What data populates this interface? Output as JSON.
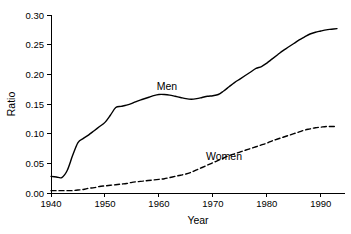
{
  "chart_data": {
    "type": "line",
    "title": "",
    "xlabel": "Year",
    "ylabel": "Ratio",
    "xlim": [
      1940,
      1993
    ],
    "ylim": [
      0.0,
      0.3
    ],
    "grid": false,
    "legend_position": "inline-annotation",
    "x_ticks": [
      1940,
      1950,
      1960,
      1970,
      1980,
      1990
    ],
    "x_tick_labels": [
      "1940",
      "1950",
      "1960",
      "1970",
      "1980",
      "1990"
    ],
    "y_ticks": [
      0.0,
      0.05,
      0.1,
      0.15,
      0.2,
      0.25,
      0.3
    ],
    "y_tick_labels": [
      "0.00",
      "0.05",
      "0.10",
      "0.15",
      "0.20",
      "0.25",
      "0.30"
    ],
    "series": [
      {
        "name": "Men",
        "style": "solid",
        "color": "#000000",
        "annotation": "Men",
        "x": [
          1940,
          1941,
          1942,
          1943,
          1944,
          1945,
          1946,
          1947,
          1948,
          1949,
          1950,
          1951,
          1952,
          1953,
          1954,
          1955,
          1956,
          1957,
          1958,
          1959,
          1960,
          1961,
          1962,
          1963,
          1964,
          1965,
          1966,
          1967,
          1968,
          1969,
          1970,
          1971,
          1972,
          1973,
          1974,
          1975,
          1976,
          1977,
          1978,
          1979,
          1980,
          1981,
          1982,
          1983,
          1984,
          1985,
          1986,
          1987,
          1988,
          1989,
          1990,
          1991,
          1992,
          1993
        ],
        "y": [
          0.028,
          0.027,
          0.026,
          0.038,
          0.063,
          0.085,
          0.092,
          0.098,
          0.105,
          0.112,
          0.119,
          0.131,
          0.144,
          0.146,
          0.148,
          0.151,
          0.155,
          0.158,
          0.161,
          0.164,
          0.166,
          0.166,
          0.165,
          0.163,
          0.161,
          0.159,
          0.158,
          0.159,
          0.161,
          0.163,
          0.164,
          0.166,
          0.172,
          0.179,
          0.186,
          0.192,
          0.198,
          0.204,
          0.21,
          0.213,
          0.219,
          0.226,
          0.233,
          0.24,
          0.246,
          0.252,
          0.258,
          0.263,
          0.268,
          0.271,
          0.273,
          0.275,
          0.276,
          0.277
        ]
      },
      {
        "name": "Women",
        "style": "dashed",
        "color": "#000000",
        "annotation": "Women",
        "x": [
          1940,
          1941,
          1942,
          1943,
          1944,
          1945,
          1946,
          1947,
          1948,
          1949,
          1950,
          1951,
          1952,
          1953,
          1954,
          1955,
          1956,
          1957,
          1958,
          1959,
          1960,
          1961,
          1962,
          1963,
          1964,
          1965,
          1966,
          1967,
          1968,
          1969,
          1970,
          1971,
          1972,
          1973,
          1974,
          1975,
          1976,
          1977,
          1978,
          1979,
          1980,
          1981,
          1982,
          1983,
          1984,
          1985,
          1986,
          1987,
          1988,
          1989,
          1990,
          1991,
          1992,
          1993
        ],
        "y": [
          0.004,
          0.004,
          0.004,
          0.004,
          0.004,
          0.005,
          0.006,
          0.008,
          0.009,
          0.011,
          0.012,
          0.013,
          0.014,
          0.015,
          0.016,
          0.018,
          0.019,
          0.02,
          0.021,
          0.022,
          0.023,
          0.024,
          0.026,
          0.028,
          0.03,
          0.032,
          0.035,
          0.039,
          0.043,
          0.047,
          0.051,
          0.055,
          0.059,
          0.063,
          0.066,
          0.069,
          0.072,
          0.075,
          0.078,
          0.081,
          0.084,
          0.088,
          0.091,
          0.094,
          0.097,
          0.1,
          0.103,
          0.106,
          0.108,
          0.11,
          0.111,
          0.112,
          0.112,
          0.112
        ]
      }
    ]
  },
  "axes": {
    "y_axis_title": "Ratio",
    "x_axis_title": "Year"
  },
  "annotations": {
    "men_label": "Men",
    "women_label": "Women"
  }
}
